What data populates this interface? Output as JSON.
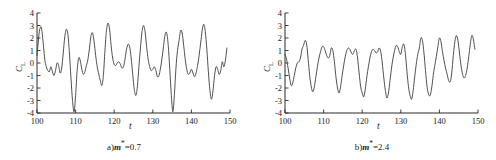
{
  "figure": {
    "panels": [
      {
        "id": "panel-a",
        "caption_prefix": "a)",
        "caption_symbol": "m",
        "caption_sup": "*",
        "caption_value": "=0.7",
        "caption_full": "a)m*=0.7",
        "ylabel_main": "C",
        "ylabel_sub": "L",
        "xlabel": "t"
      },
      {
        "id": "panel-b",
        "caption_prefix": "b)",
        "caption_symbol": "m",
        "caption_sup": "*",
        "caption_value": "=2.4",
        "caption_full": "b)m*=2.4",
        "ylabel_main": "C",
        "ylabel_sub": "L",
        "xlabel": "t"
      }
    ]
  },
  "chart_data": [
    {
      "type": "line",
      "title": "a)m*=0.7",
      "xlabel": "t",
      "ylabel": "C_L",
      "xlim": [
        100,
        150
      ],
      "ylim": [
        -4,
        4
      ],
      "xticks": [
        100,
        110,
        120,
        130,
        140,
        150
      ],
      "yticks": [
        -4,
        -3,
        -2,
        -1,
        0,
        1,
        2,
        3,
        4
      ],
      "grid": false,
      "legend": "none",
      "line_color": "#3d3d3d",
      "series": [
        {
          "name": "CL",
          "x": [
            100.0,
            100.3,
            100.6,
            101.0,
            101.3,
            101.7,
            102.0,
            102.4,
            102.8,
            103.2,
            103.6,
            104.0,
            104.4,
            104.8,
            105.2,
            105.6,
            106.0,
            106.4,
            106.8,
            107.2,
            107.6,
            108.0,
            108.4,
            108.8,
            109.2,
            109.6,
            110.0,
            110.4,
            110.8,
            111.2,
            111.6,
            112.0,
            112.4,
            112.8,
            113.2,
            113.6,
            114.0,
            114.4,
            114.8,
            115.2,
            115.6,
            116.0,
            116.4,
            116.8,
            117.2,
            117.6,
            118.0,
            118.4,
            118.8,
            119.2,
            119.6,
            120.0,
            120.4,
            120.8,
            121.2,
            121.6,
            122.0,
            122.4,
            122.8,
            123.2,
            123.6,
            124.0,
            124.4,
            124.8,
            125.2,
            125.6,
            126.0,
            126.4,
            126.8,
            127.2,
            127.6,
            128.0,
            128.4,
            128.8,
            129.2,
            129.6,
            130.0,
            130.4,
            130.8,
            131.2,
            131.6,
            132.0,
            132.4,
            132.8,
            133.2,
            133.6,
            134.0,
            134.4,
            134.8,
            135.2,
            135.6,
            136.0,
            136.4,
            136.8,
            137.2,
            137.6,
            138.0,
            138.4,
            138.8,
            139.2,
            139.6,
            140.0,
            140.4,
            140.8,
            141.2,
            141.6,
            142.0,
            142.4,
            142.8,
            143.2,
            143.6,
            144.0,
            144.4,
            144.8,
            145.2,
            145.6,
            146.0,
            146.4,
            146.8,
            147.2,
            147.6,
            148.0,
            148.4,
            148.8,
            149.2,
            149.6,
            150.0
          ],
          "y": [
            0.6,
            1.6,
            2.5,
            2.9,
            2.5,
            1.3,
            0.3,
            -0.3,
            -0.6,
            -0.7,
            -0.3,
            -0.7,
            -1.0,
            -0.6,
            0.0,
            -0.2,
            -0.8,
            -0.4,
            0.8,
            2.1,
            2.7,
            2.3,
            0.8,
            -1.2,
            -3.0,
            -3.9,
            -2.6,
            -0.6,
            0.4,
            0.2,
            -0.5,
            -0.9,
            -0.7,
            -0.2,
            0.3,
            1.2,
            2.2,
            2.4,
            1.7,
            0.6,
            -0.3,
            -0.9,
            -1.4,
            -1.8,
            -1.0,
            1.0,
            2.6,
            3.2,
            2.7,
            1.4,
            0.4,
            -0.1,
            -0.2,
            0.0,
            0.1,
            -0.1,
            -0.4,
            -0.3,
            0.3,
            1.1,
            1.5,
            1.3,
            0.4,
            -0.9,
            -2.1,
            -2.6,
            -1.9,
            -0.3,
            1.2,
            2.5,
            3.0,
            2.5,
            1.3,
            0.3,
            -0.3,
            -0.6,
            -0.5,
            -0.3,
            -0.6,
            -1.1,
            -1.0,
            -0.4,
            0.4,
            1.4,
            2.3,
            2.4,
            1.4,
            -0.5,
            -2.6,
            -3.9,
            -2.5,
            -0.4,
            1.0,
            1.8,
            2.6,
            2.4,
            1.4,
            0.3,
            -0.5,
            -0.9,
            -0.8,
            -0.5,
            -0.8,
            -1.1,
            -0.8,
            -0.2,
            0.6,
            1.6,
            2.6,
            3.1,
            2.5,
            1.1,
            -0.7,
            -2.2,
            -2.9,
            -2.2,
            -1.0,
            -0.3,
            -0.5,
            -0.9,
            -0.6,
            0.1,
            -0.3,
            0.2,
            1.2,
            2.1
          ]
        }
      ]
    },
    {
      "type": "line",
      "title": "b)m*=2.4",
      "xlabel": "t",
      "ylabel": "C_L",
      "xlim": [
        100,
        150
      ],
      "ylim": [
        -4,
        4
      ],
      "xticks": [
        100,
        110,
        120,
        130,
        140,
        150
      ],
      "yticks": [
        -4,
        -3,
        -2,
        -1,
        0,
        1,
        2,
        3,
        4
      ],
      "grid": false,
      "legend": "none",
      "line_color": "#3d3d3d",
      "series": [
        {
          "name": "CL",
          "x": [
            100.0,
            100.4,
            100.8,
            101.2,
            101.6,
            102.0,
            102.4,
            102.8,
            103.2,
            103.6,
            104.0,
            104.4,
            104.8,
            105.2,
            105.6,
            106.0,
            106.4,
            106.8,
            107.2,
            107.6,
            108.0,
            108.4,
            108.8,
            109.2,
            109.6,
            110.0,
            110.4,
            110.8,
            111.2,
            111.6,
            112.0,
            112.4,
            112.8,
            113.2,
            113.6,
            114.0,
            114.4,
            114.8,
            115.2,
            115.6,
            116.0,
            116.4,
            116.8,
            117.2,
            117.6,
            118.0,
            118.4,
            118.8,
            119.2,
            119.6,
            120.0,
            120.4,
            120.8,
            121.2,
            121.6,
            122.0,
            122.4,
            122.8,
            123.2,
            123.6,
            124.0,
            124.4,
            124.8,
            125.2,
            125.6,
            126.0,
            126.4,
            126.8,
            127.2,
            127.6,
            128.0,
            128.4,
            128.8,
            129.2,
            129.6,
            130.0,
            130.4,
            130.8,
            131.2,
            131.6,
            132.0,
            132.4,
            132.8,
            133.2,
            133.6,
            134.0,
            134.4,
            134.8,
            135.2,
            135.6,
            136.0,
            136.4,
            136.8,
            137.2,
            137.6,
            138.0,
            138.4,
            138.8,
            139.2,
            139.6,
            140.0,
            140.4,
            140.8,
            141.2,
            141.6,
            142.0,
            142.4,
            142.8,
            143.2,
            143.6,
            144.0,
            144.4,
            144.8,
            145.2,
            145.6,
            146.0,
            146.4,
            146.8,
            147.2,
            147.6,
            148.0,
            148.4,
            148.8,
            149.2,
            149.6,
            150.0
          ],
          "y": [
            0.7,
            0.3,
            -0.4,
            -1.2,
            -1.8,
            -1.6,
            -1.0,
            -0.4,
            0.0,
            0.1,
            0.4,
            1.1,
            1.4,
            1.8,
            1.5,
            0.3,
            -1.0,
            -1.9,
            -2.3,
            -1.9,
            -1.1,
            -0.3,
            0.4,
            0.9,
            1.3,
            1.3,
            1.0,
            0.6,
            0.4,
            0.6,
            1.2,
            1.0,
            0.1,
            -1.1,
            -2.0,
            -2.4,
            -1.9,
            -1.0,
            -0.2,
            0.5,
            1.0,
            1.2,
            1.1,
            0.8,
            0.7,
            1.0,
            1.1,
            0.4,
            -0.8,
            -1.9,
            -2.4,
            -2.7,
            -2.1,
            -1.1,
            -0.3,
            0.4,
            0.9,
            1.1,
            1.0,
            0.8,
            0.9,
            1.2,
            0.9,
            0.0,
            -1.2,
            -2.2,
            -2.8,
            -2.4,
            -1.4,
            -0.4,
            0.4,
            1.0,
            1.4,
            1.3,
            0.9,
            0.7,
            1.3,
            1.5,
            0.7,
            -0.7,
            -1.9,
            -2.6,
            -2.9,
            -2.2,
            -1.1,
            -0.1,
            0.7,
            1.2,
            2.0,
            1.8,
            0.8,
            -0.6,
            -1.9,
            -2.5,
            -2.6,
            -2.0,
            -1.0,
            -0.2,
            0.5,
            1.3,
            2.0,
            1.7,
            0.9,
            0.2,
            -0.4,
            -0.9,
            -1.4,
            -1.5,
            -0.8,
            0.6,
            1.7,
            2.2,
            1.8,
            0.8,
            -0.2,
            -0.9,
            -1.2,
            -1.0,
            -0.4,
            0.5,
            1.5,
            2.2,
            1.9,
            1.1,
            0.9
          ]
        }
      ]
    }
  ]
}
